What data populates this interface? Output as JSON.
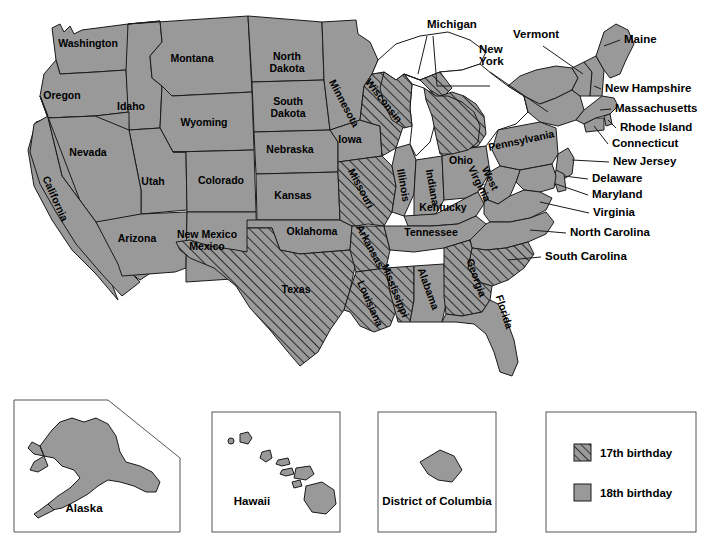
{
  "colors": {
    "solid_fill": "#999999",
    "hatch_fill": "#999999",
    "outline": "#1a1a1a",
    "background": "#ffffff",
    "box_border": "#555555",
    "text": "#000000"
  },
  "legend": {
    "items": [
      {
        "pattern": "hatched",
        "label": "17th birthday"
      },
      {
        "pattern": "solid",
        "label": "18th birthday"
      }
    ]
  },
  "insets": [
    {
      "key": "alaska",
      "label": "Alaska",
      "pattern": "solid"
    },
    {
      "key": "hawaii",
      "label": "Hawaii",
      "pattern": "solid"
    },
    {
      "key": "dc",
      "label": "District of Columbia",
      "pattern": "solid"
    }
  ],
  "map": {
    "inner_labels": [
      {
        "name": "Washington",
        "label": "Washington",
        "x": 88,
        "y": 47,
        "rotate": 0,
        "pattern": "solid"
      },
      {
        "name": "Oregon",
        "label": "Oregon",
        "x": 62,
        "y": 99,
        "rotate": 0,
        "pattern": "solid"
      },
      {
        "name": "Montana",
        "label": "Montana",
        "x": 192,
        "y": 62,
        "rotate": 0,
        "pattern": "solid"
      },
      {
        "name": "Idaho",
        "label": "Idaho",
        "x": 131,
        "y": 110,
        "rotate": 0,
        "pattern": "solid"
      },
      {
        "name": "Wyoming",
        "label": "Wyoming",
        "x": 204,
        "y": 126,
        "rotate": 0,
        "pattern": "solid"
      },
      {
        "name": "Nevada",
        "label": "Nevada",
        "x": 88,
        "y": 156,
        "rotate": 0,
        "pattern": "solid"
      },
      {
        "name": "Utah",
        "label": "Utah",
        "x": 153,
        "y": 185,
        "rotate": 0,
        "pattern": "solid"
      },
      {
        "name": "Colorado",
        "label": "Colorado",
        "x": 221,
        "y": 184,
        "rotate": 0,
        "pattern": "solid"
      },
      {
        "name": "California",
        "label": "California",
        "x": 52,
        "y": 200,
        "rotate": 66,
        "pattern": "solid"
      },
      {
        "name": "Arizona",
        "label": "Arizona",
        "x": 137,
        "y": 242,
        "rotate": 0,
        "pattern": "solid"
      },
      {
        "name": "New Mexico",
        "label": "New Mexico",
        "x": 207,
        "y": 238,
        "rotate": 0,
        "pattern": "solid",
        "line2": "Mexico"
      },
      {
        "name": "North Dakota",
        "label": "North",
        "x": 287,
        "y": 60,
        "rotate": 0,
        "pattern": "solid",
        "line2": "Dakota"
      },
      {
        "name": "South Dakota",
        "label": "South",
        "x": 288,
        "y": 105,
        "rotate": 0,
        "pattern": "solid",
        "line2": "Dakota"
      },
      {
        "name": "Nebraska",
        "label": "Nebraska",
        "x": 290,
        "y": 153,
        "rotate": 0,
        "pattern": "solid"
      },
      {
        "name": "Kansas",
        "label": "Kansas",
        "x": 293,
        "y": 199,
        "rotate": 0,
        "pattern": "solid"
      },
      {
        "name": "Oklahoma",
        "label": "Oklahoma",
        "x": 312,
        "y": 235,
        "rotate": 0,
        "pattern": "solid"
      },
      {
        "name": "Texas",
        "label": "Texas",
        "x": 296,
        "y": 293,
        "rotate": 0,
        "pattern": "hatched"
      },
      {
        "name": "Minnesota",
        "label": "Minnesota",
        "x": 341,
        "y": 105,
        "rotate": 62,
        "pattern": "solid"
      },
      {
        "name": "Iowa",
        "label": "Iowa",
        "x": 350,
        "y": 143,
        "rotate": 0,
        "pattern": "solid"
      },
      {
        "name": "Missouri",
        "label": "Missouri",
        "x": 358,
        "y": 190,
        "rotate": 62,
        "pattern": "hatched"
      },
      {
        "name": "Arkansas",
        "label": "Arkansas",
        "x": 367,
        "y": 248,
        "rotate": 62,
        "pattern": "hatched"
      },
      {
        "name": "Louisiana",
        "label": "Louisiana",
        "x": 367,
        "y": 305,
        "rotate": 66,
        "pattern": "hatched"
      },
      {
        "name": "Wisconsin",
        "label": "Wisconsin",
        "x": 381,
        "y": 103,
        "rotate": 52,
        "pattern": "hatched"
      },
      {
        "name": "Illinois",
        "label": "Illinois",
        "x": 400,
        "y": 186,
        "rotate": 80,
        "pattern": "solid"
      },
      {
        "name": "Mississippi",
        "label": "Mississippi",
        "x": 392,
        "y": 292,
        "rotate": 68,
        "pattern": "hatched"
      },
      {
        "name": "Indiana",
        "label": "Indiana",
        "x": 429,
        "y": 188,
        "rotate": 80,
        "pattern": "solid"
      },
      {
        "name": "Alabama",
        "label": "Alabama",
        "x": 425,
        "y": 290,
        "rotate": 70,
        "pattern": "solid"
      },
      {
        "name": "Ohio",
        "label": "Ohio",
        "x": 461,
        "y": 164,
        "rotate": 0,
        "pattern": "solid"
      },
      {
        "name": "Kentucky",
        "label": "Kentucky",
        "x": 443,
        "y": 211,
        "rotate": 0,
        "pattern": "solid"
      },
      {
        "name": "Tennessee",
        "label": "Tennessee",
        "x": 431,
        "y": 236,
        "rotate": 0,
        "pattern": "solid"
      },
      {
        "name": "West Virginia",
        "label": "West",
        "x": 487,
        "y": 180,
        "rotate": 64,
        "pattern": "solid",
        "line2": "Virginia"
      },
      {
        "name": "Pennsylvania",
        "label": "Pennsylvania",
        "x": 522,
        "y": 144,
        "rotate": -12,
        "pattern": "solid"
      },
      {
        "name": "Georgia",
        "label": "Georgia",
        "x": 473,
        "y": 279,
        "rotate": 70,
        "pattern": "hatched"
      },
      {
        "name": "Florida",
        "label": "Florida",
        "x": 501,
        "y": 313,
        "rotate": 72,
        "pattern": "solid"
      }
    ],
    "outer_labels": [
      {
        "name": "Michigan",
        "label": "Michigan",
        "x": 427,
        "y": 28,
        "pattern": "hatched",
        "anchor": "middle"
      },
      {
        "name": "Vermont",
        "label": "Vermont",
        "x": 513,
        "y": 38,
        "pattern": "solid",
        "anchor": "start"
      },
      {
        "name": "New York",
        "label": "New",
        "x": 479,
        "y": 53,
        "pattern": "solid",
        "anchor": "start",
        "line2": "York"
      },
      {
        "name": "Maine",
        "label": "Maine",
        "x": 624,
        "y": 43,
        "pattern": "solid",
        "anchor": "start"
      },
      {
        "name": "New Hampshire",
        "label": "New Hampshire",
        "x": 605,
        "y": 92,
        "pattern": "solid",
        "anchor": "start"
      },
      {
        "name": "Massachusetts",
        "label": "Massachusetts",
        "x": 615,
        "y": 112,
        "pattern": "solid",
        "anchor": "start"
      },
      {
        "name": "Rhode Island",
        "label": "Rhode Island",
        "x": 620,
        "y": 131,
        "pattern": "solid",
        "anchor": "start"
      },
      {
        "name": "Connecticut",
        "label": "Connecticut",
        "x": 612,
        "y": 147,
        "pattern": "solid",
        "anchor": "start"
      },
      {
        "name": "New Jersey",
        "label": "New Jersey",
        "x": 613,
        "y": 165,
        "pattern": "solid",
        "anchor": "start"
      },
      {
        "name": "Delaware",
        "label": "Delaware",
        "x": 592,
        "y": 182,
        "pattern": "solid",
        "anchor": "start"
      },
      {
        "name": "Maryland",
        "label": "Maryland",
        "x": 592,
        "y": 198,
        "pattern": "solid",
        "anchor": "start"
      },
      {
        "name": "Virginia",
        "label": "Virginia",
        "x": 593,
        "y": 216,
        "pattern": "solid",
        "anchor": "start"
      },
      {
        "name": "North Carolina",
        "label": "North Carolina",
        "x": 570,
        "y": 236,
        "pattern": "solid",
        "anchor": "start"
      },
      {
        "name": "South Carolina",
        "label": "South Carolina",
        "x": 545,
        "y": 260,
        "pattern": "hatched",
        "anchor": "start"
      }
    ]
  }
}
